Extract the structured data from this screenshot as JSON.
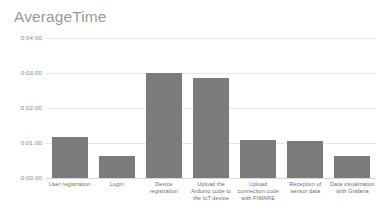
{
  "chart_data": {
    "type": "bar",
    "title": "AverageTime",
    "xlabel": "",
    "ylabel": "",
    "categories": [
      "User registration",
      "Login",
      "Device registration",
      "Upload the Arduino code to the IoT device",
      "Upload connection code with FIWARE",
      "Reception of sensor data",
      "Data visualization with Grafana"
    ],
    "values": [
      70,
      37,
      180,
      172,
      65,
      63,
      37
    ],
    "value_labels": [
      "0:01:10",
      "0:00:37",
      "0:03:00",
      "0:02:52",
      "0:01:05",
      "0:01:03",
      "0:00:37"
    ],
    "ytick_labels": [
      "0:04:00",
      "0:03:00",
      "0:02:00",
      "0:01:00",
      "0:00:00"
    ],
    "ytick_values": [
      240,
      180,
      120,
      60,
      0
    ],
    "ylim": [
      0,
      240
    ],
    "grid": true,
    "legend": false,
    "bar_color": "#7b7b7b",
    "grid_color": "#e8e8e8",
    "title_color": "#9a9a9a",
    "tick_color": "#8d8d8d",
    "background": "#ffffff"
  }
}
